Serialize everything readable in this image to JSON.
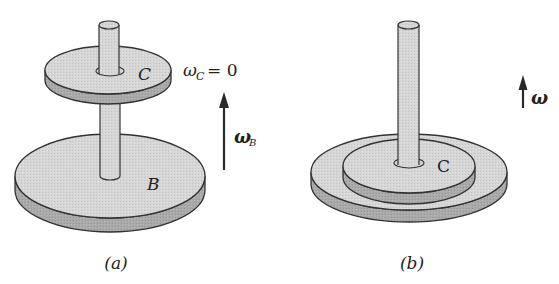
{
  "figure": {
    "panels": [
      {
        "id": "a",
        "caption": "(a)",
        "disks": [
          {
            "label": "C",
            "position": "upper"
          },
          {
            "label": "B",
            "position": "lower"
          }
        ],
        "omega_c_label": "ω",
        "omega_c_sub": "C",
        "omega_c_value": "= 0",
        "omega_b_label": "ω",
        "omega_b_sub": "B"
      },
      {
        "id": "b",
        "caption": "(b)",
        "disks": [
          {
            "label": "C",
            "position": "stacked-top"
          }
        ],
        "omega_label": "ω"
      }
    ],
    "colors": {
      "disk_top": "#d4d4d4",
      "disk_side": "#a8a8a8",
      "outline": "#333333",
      "arrow": "#2a2a2a"
    }
  }
}
